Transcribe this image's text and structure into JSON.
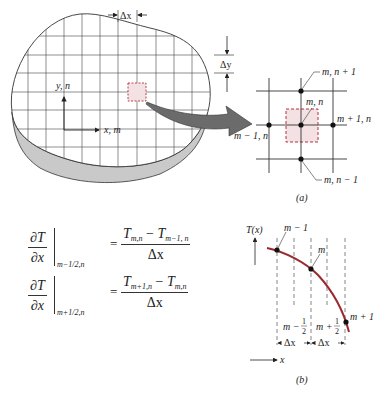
{
  "figure_a": {
    "caption": "(a)",
    "plate_labels": {
      "dx": "Δx",
      "dy": "Δy",
      "y_axis": "y, n",
      "x_axis": "x, m"
    },
    "node_labels": {
      "top": "m, n + 1",
      "center": "m, n",
      "right": "m + 1, n",
      "left": "m − 1, n",
      "bottom": "m, n − 1"
    },
    "colors": {
      "control_volume_fill": "#f3e1e4",
      "control_volume_border": "#b5323c",
      "plate_side": "#c9c9c9",
      "arrow": "#6b6b6b"
    }
  },
  "equations": [
    {
      "lhs_num": "∂T",
      "lhs_den": "∂x",
      "eval_at": "m−1/2,n",
      "equals": "=",
      "rhs_num_a": "T",
      "rhs_num_a_sub": "m,n",
      "rhs_minus": " − ",
      "rhs_num_b": "T",
      "rhs_num_b_sub": "m−1, n",
      "rhs_den": "Δx"
    },
    {
      "lhs_num": "∂T",
      "lhs_den": "∂x",
      "eval_at": "m+1/2,n",
      "equals": "=",
      "rhs_num_a": "T",
      "rhs_num_a_sub": "m+1,n",
      "rhs_minus": " − ",
      "rhs_num_b": "T",
      "rhs_num_b_sub": "m,n",
      "rhs_den": "Δx"
    }
  ],
  "figure_b": {
    "caption": "(b)",
    "y_label": "T(x)",
    "x_label": "x",
    "points": [
      {
        "label": "m − 1"
      },
      {
        "label": "m"
      },
      {
        "label": "m + 1"
      }
    ],
    "half_labels": {
      "left": "m −",
      "right": "m +",
      "half_num": "1",
      "half_den": "2"
    },
    "spacing_labels": [
      "Δx",
      "Δx"
    ],
    "colors": {
      "curve": "#9b2a2e"
    }
  }
}
